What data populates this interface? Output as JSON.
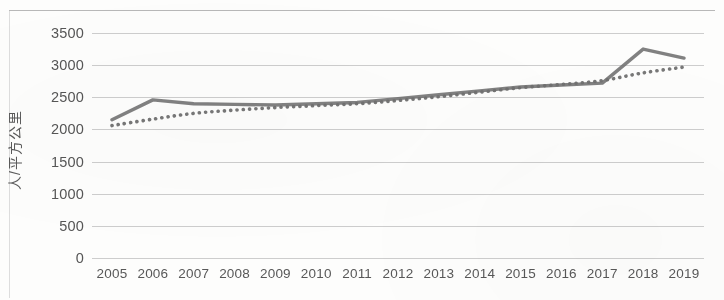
{
  "chart_data": {
    "type": "line",
    "title": "",
    "subtitle": "",
    "xlabel": "",
    "ylabel": "人/平方公里",
    "ylim": [
      0,
      3500
    ],
    "ytick_step": 500,
    "yticks": [
      "3500",
      "3000",
      "2500",
      "2000",
      "1500",
      "1000",
      "500",
      "0"
    ],
    "grid": true,
    "legend": "none",
    "categories": [
      "2005",
      "2006",
      "2007",
      "2008",
      "2009",
      "2010",
      "2011",
      "2012",
      "2013",
      "2014",
      "2015",
      "2016",
      "2017",
      "2018",
      "2019"
    ],
    "series": [
      {
        "name": "实际人口密度",
        "style": "solid",
        "color": "#6f6f6f",
        "values": [
          2150,
          2460,
          2400,
          2390,
          2380,
          2400,
          2420,
          2480,
          2540,
          2600,
          2660,
          2690,
          2720,
          3250,
          3110
        ]
      },
      {
        "name": "趋势线",
        "style": "dotted",
        "color": "#5f5f5f",
        "values": [
          2060,
          2160,
          2250,
          2300,
          2340,
          2370,
          2400,
          2450,
          2510,
          2580,
          2650,
          2700,
          2760,
          2880,
          2970
        ]
      }
    ]
  },
  "axis": {
    "y_title": "人/平方公里"
  }
}
